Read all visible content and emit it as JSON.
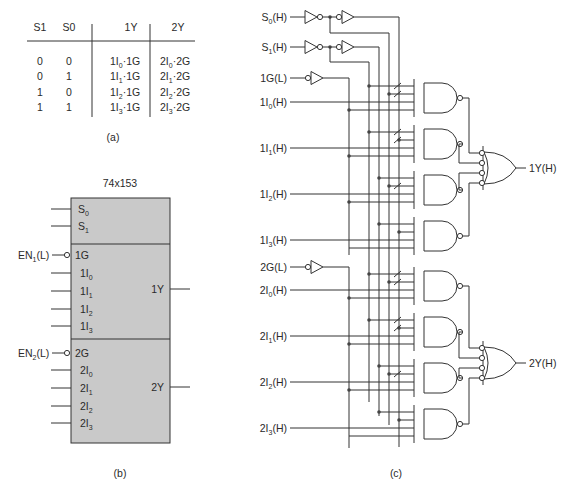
{
  "figure_a": {
    "caption": "(a)",
    "headers": [
      "S1",
      "S0",
      "1Y",
      "2Y"
    ],
    "rows": [
      {
        "s1": "0",
        "s0": "0",
        "y1": {
          "pre": "1I",
          "sub": "0",
          "post": "·1G"
        },
        "y2": {
          "pre": "2I",
          "sub": "0",
          "post": "·2G"
        }
      },
      {
        "s1": "0",
        "s0": "1",
        "y1": {
          "pre": "1I",
          "sub": "1",
          "post": "·1G"
        },
        "y2": {
          "pre": "2I",
          "sub": "1",
          "post": "·2G"
        }
      },
      {
        "s1": "1",
        "s0": "0",
        "y1": {
          "pre": "1I",
          "sub": "2",
          "post": "·1G"
        },
        "y2": {
          "pre": "2I",
          "sub": "2",
          "post": "·2G"
        }
      },
      {
        "s1": "1",
        "s0": "1",
        "y1": {
          "pre": "1I",
          "sub": "3",
          "post": "·1G"
        },
        "y2": {
          "pre": "2I",
          "sub": "3",
          "post": "·2G"
        }
      }
    ]
  },
  "figure_b": {
    "caption": "(b)",
    "chip_name": "74x153",
    "select_pins": [
      {
        "pre": "S",
        "sub": "0"
      },
      {
        "pre": "S",
        "sub": "1"
      }
    ],
    "section1": {
      "enable_label": {
        "pre": "EN",
        "sub": "1",
        "post": "(L)"
      },
      "enable_pin": "1G",
      "inputs": [
        {
          "pre": "1I",
          "sub": "0"
        },
        {
          "pre": "1I",
          "sub": "1"
        },
        {
          "pre": "1I",
          "sub": "2"
        },
        {
          "pre": "1I",
          "sub": "3"
        }
      ],
      "output": "1Y"
    },
    "section2": {
      "enable_label": {
        "pre": "EN",
        "sub": "2",
        "post": "(L)"
      },
      "enable_pin": "2G",
      "inputs": [
        {
          "pre": "2I",
          "sub": "0"
        },
        {
          "pre": "2I",
          "sub": "1"
        },
        {
          "pre": "2I",
          "sub": "2"
        },
        {
          "pre": "2I",
          "sub": "3"
        }
      ],
      "output": "2Y"
    }
  },
  "figure_c": {
    "caption": "(c)",
    "select_inputs": [
      {
        "pre": "S",
        "sub": "0",
        "post": "(H)"
      },
      {
        "pre": "S",
        "sub": "1",
        "post": "(H)"
      }
    ],
    "enable1": "1G(L)",
    "inputs1": [
      {
        "pre": "1I",
        "sub": "0",
        "post": "(H)"
      },
      {
        "pre": "1I",
        "sub": "1",
        "post": "(H)"
      },
      {
        "pre": "1I",
        "sub": "2",
        "post": "(H)"
      },
      {
        "pre": "1I",
        "sub": "3",
        "post": "(H)"
      }
    ],
    "enable2": "2G(L)",
    "inputs2": [
      {
        "pre": "2I",
        "sub": "0",
        "post": "(H)"
      },
      {
        "pre": "2I",
        "sub": "1",
        "post": "(H)"
      },
      {
        "pre": "2I",
        "sub": "2",
        "post": "(H)"
      },
      {
        "pre": "2I",
        "sub": "3",
        "post": "(H)"
      }
    ],
    "output1": "1Y(H)",
    "output2": "2Y(H)"
  }
}
